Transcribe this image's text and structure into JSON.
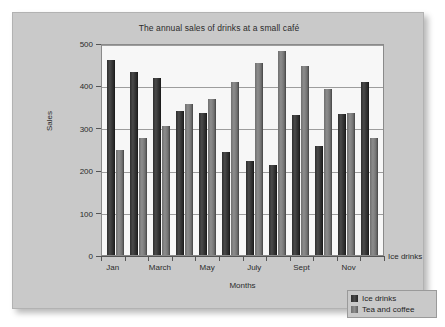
{
  "chart_data": {
    "type": "bar",
    "title": "The annual sales of drinks at a small café",
    "xlabel": "Months",
    "ylabel": "Sales",
    "ylim": [
      0,
      500
    ],
    "yticks": [
      0,
      100,
      200,
      300,
      400,
      500
    ],
    "grid": true,
    "legend_position": "bottom-right",
    "categories": [
      "Jan",
      "Feb",
      "March",
      "April",
      "May",
      "June",
      "July",
      "Aug",
      "Sept",
      "Oct",
      "Nov",
      "Dec"
    ],
    "visible_tick_labels": [
      "Jan",
      "",
      "March",
      "",
      "May",
      "",
      "July",
      "",
      "Sept",
      "",
      "Nov",
      ""
    ],
    "series": [
      {
        "name": "Ice drinks",
        "color": "#3a3a3a",
        "values": [
          460,
          432,
          418,
          340,
          334,
          243,
          221,
          212,
          330,
          258,
          333,
          409
        ]
      },
      {
        "name": "Tea and coffee",
        "color": "#808080",
        "values": [
          248,
          275,
          305,
          357,
          367,
          409,
          452,
          481,
          446,
          391,
          336,
          276
        ]
      }
    ],
    "annotations": [
      {
        "name": "axis-stray-series-label",
        "text": "Ice drinks"
      }
    ]
  },
  "legend": {
    "items": [
      {
        "label": "Ice drinks",
        "swatch": "ice"
      },
      {
        "label": "Tea and coffee",
        "swatch": "tea"
      }
    ]
  },
  "colors": {
    "panel_background": "#c9c9c9",
    "plot_background": "#f7f7f7",
    "gridline": "#9d9d9d",
    "axis": "#555555",
    "text": "#2b2b2b"
  }
}
